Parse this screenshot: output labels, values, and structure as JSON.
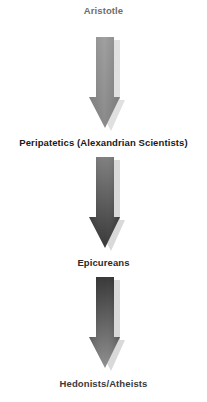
{
  "diagram": {
    "type": "vertical-flow",
    "nodes": [
      {
        "label": "Aristotle",
        "color": "#6e6e6e"
      },
      {
        "label": "Peripatetics (Alexandrian Scientists)",
        "color": "#1a1a1a"
      },
      {
        "label": "Epicureans",
        "color": "#2a2a2a"
      },
      {
        "label": "Hedonists/Atheists",
        "color": "#3a3a3a"
      }
    ],
    "edges": [
      {
        "from": 0,
        "to": 1,
        "style": "down-arrow",
        "gradient": [
          "#a0a0a0",
          "#8a8a8a"
        ]
      },
      {
        "from": 1,
        "to": 2,
        "style": "down-arrow",
        "gradient": [
          "#7a7a7a",
          "#333333"
        ]
      },
      {
        "from": 2,
        "to": 3,
        "style": "down-arrow",
        "gradient": [
          "#2e2e2e",
          "#8a8a8a"
        ]
      }
    ]
  }
}
